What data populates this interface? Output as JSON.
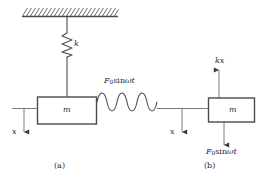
{
  "figure": {
    "background_color": "#ffffff",
    "line_color": "#4a4a4a",
    "text_color": "#2b2b2b",
    "width": 262,
    "height": 182
  },
  "panel_a": {
    "caption": "(a)",
    "ceiling": {
      "name": "hatched-fixed-support"
    },
    "spring_label": "k",
    "mass_label": "m",
    "displacement_label": "x",
    "force_label_parts": {
      "symbol": "F",
      "subscript": "0",
      "function": "sin",
      "argument_omega": "ω",
      "argument_t": "t"
    },
    "force_label": "F0 sin ωt",
    "excitation": {
      "name": "sinusoidal-wave",
      "cycles": 3
    }
  },
  "panel_b": {
    "caption": "(b)",
    "mass_label": "m",
    "displacement_label": "x",
    "spring_force_label": "kx",
    "force_label_parts": {
      "symbol": "F",
      "subscript": "0",
      "function": "sin",
      "argument_omega": "ω",
      "argument_t": "t"
    },
    "force_label": "F0 sin ωt",
    "spring_force_direction": "up",
    "applied_force_direction": "down",
    "displacement_direction": "down"
  }
}
